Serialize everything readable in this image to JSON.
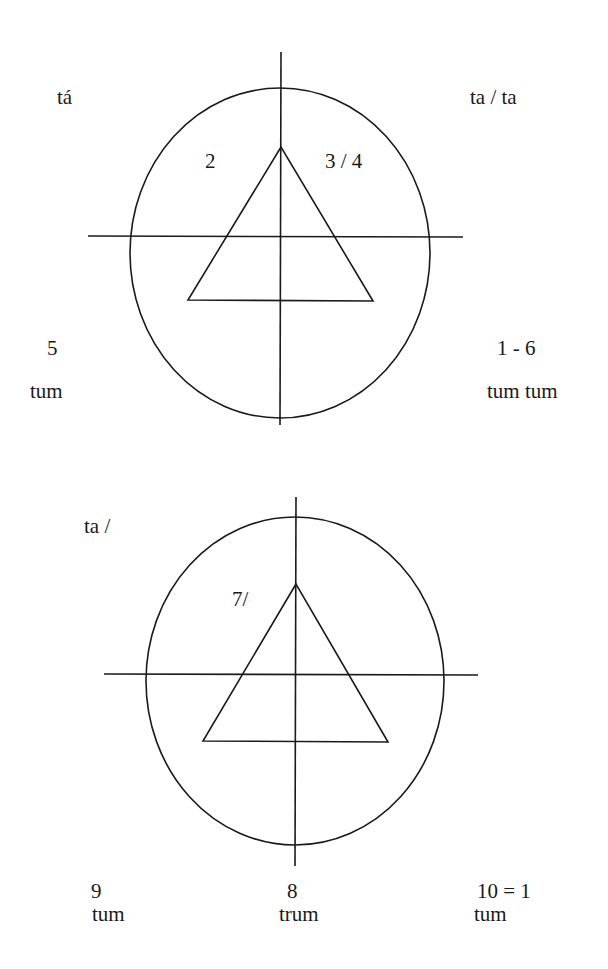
{
  "diagrams": [
    {
      "id": "top",
      "labels": {
        "top_left": "tá",
        "top_right": "ta / ta",
        "inner_left": "2",
        "inner_right": "3 / 4",
        "bottom_left_number": "5",
        "bottom_left_word": "tum",
        "bottom_right_number": "1 - 6",
        "bottom_right_word": "tum tum"
      }
    },
    {
      "id": "bottom",
      "labels": {
        "top_left": "ta /",
        "inner_left": "7/",
        "bottom_left_number": "9",
        "bottom_left_word": "tum",
        "bottom_center_number": "8",
        "bottom_center_word": "trum",
        "bottom_right_number": "10 = 1",
        "bottom_right_word": "tum"
      }
    }
  ],
  "colors": {
    "line": "#1a1a1a",
    "background": "#ffffff"
  }
}
